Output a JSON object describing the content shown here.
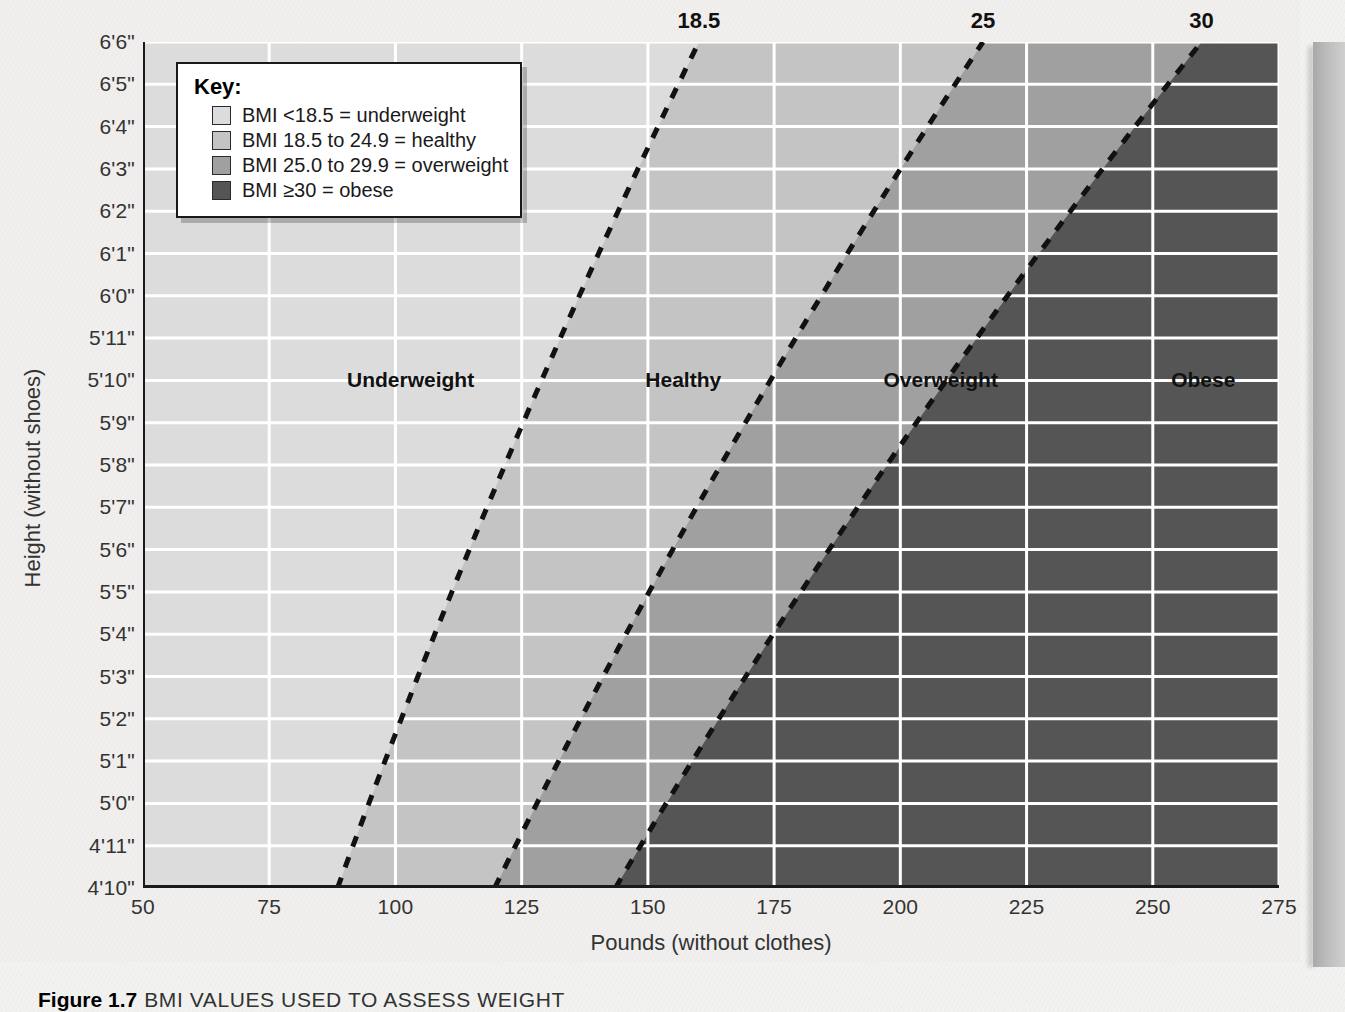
{
  "figure": {
    "caption_figure_number": "Figure 1.7",
    "caption_text": "BMI VALUES USED TO ASSESS WEIGHT"
  },
  "axes": {
    "x_title": "Pounds (without clothes)",
    "y_title": "Height (without shoes)",
    "x_ticks": [
      "50",
      "75",
      "100",
      "125",
      "150",
      "175",
      "200",
      "225",
      "250",
      "275"
    ],
    "y_ticks": [
      "6'6\"",
      "6'5\"",
      "6'4\"",
      "6'3\"",
      "6'2\"",
      "6'1\"",
      "6'0\"",
      "5'11\"",
      "5'10\"",
      "5'9\"",
      "5'8\"",
      "5'7\"",
      "5'6\"",
      "5'5\"",
      "5'4\"",
      "5'3\"",
      "5'2\"",
      "5'1\"",
      "5'0\"",
      "4'11\"",
      "4'10\""
    ]
  },
  "key": {
    "title": "Key:",
    "items": [
      {
        "label": "BMI <18.5 = underweight",
        "color": "#dcdcdc"
      },
      {
        "label": "BMI 18.5 to 24.9 = healthy",
        "color": "#c4c4c4"
      },
      {
        "label": "BMI 25.0 to 29.9 = overweight",
        "color": "#a0a0a0"
      },
      {
        "label": "BMI ≥30 = obese",
        "color": "#555555"
      }
    ]
  },
  "region_labels": [
    {
      "label": "Underweight",
      "x_lb": 103,
      "y_height_in": 70
    },
    {
      "label": "Healthy",
      "x_lb": 157,
      "y_height_in": 70
    },
    {
      "label": "Overweight",
      "x_lb": 208,
      "y_height_in": 70
    },
    {
      "label": "Obese",
      "x_lb": 260,
      "y_height_in": 70
    }
  ],
  "top_boundary_labels": [
    {
      "label": "18.5",
      "bmi": 18.5
    },
    {
      "label": "25",
      "bmi": 25
    },
    {
      "label": "30",
      "bmi": 30
    }
  ],
  "chart_data": {
    "type": "area",
    "title": "BMI VALUES USED TO ASSESS WEIGHT",
    "xlabel": "Pounds (without clothes)",
    "ylabel": "Height (without shoes)",
    "xlim": [
      50,
      275
    ],
    "ylim_inches": [
      58,
      78
    ],
    "x_major_step": 25,
    "x_minor_step": 5,
    "grid": true,
    "grid_color": "#ffffff",
    "formula": "BMI = 703 * pounds / inches^2",
    "boundary_lines": [
      {
        "bmi": 18.5,
        "label": "18.5",
        "style": "dashed",
        "points_lb_at_height_in": [
          {
            "height_in": 58,
            "pounds": 88.5
          },
          {
            "height_in": 62,
            "pounds": 101.2
          },
          {
            "height_in": 66,
            "pounds": 114.6
          },
          {
            "height_in": 70,
            "pounds": 128.9
          },
          {
            "height_in": 74,
            "pounds": 144.1
          },
          {
            "height_in": 78,
            "pounds": 160.1
          }
        ]
      },
      {
        "bmi": 25,
        "label": "25",
        "style": "dashed",
        "points_lb_at_height_in": [
          {
            "height_in": 58,
            "pounds": 119.6
          },
          {
            "height_in": 62,
            "pounds": 136.7
          },
          {
            "height_in": 66,
            "pounds": 154.9
          },
          {
            "height_in": 70,
            "pounds": 174.2
          },
          {
            "height_in": 74,
            "pounds": 194.7
          },
          {
            "height_in": 78,
            "pounds": 216.4
          }
        ]
      },
      {
        "bmi": 30,
        "label": "30",
        "style": "dashed",
        "points_lb_at_height_in": [
          {
            "height_in": 58,
            "pounds": 143.5
          },
          {
            "height_in": 62,
            "pounds": 164.0
          },
          {
            "height_in": 66,
            "pounds": 185.8
          },
          {
            "height_in": 70,
            "pounds": 209.1
          },
          {
            "height_in": 74,
            "pounds": 233.7
          },
          {
            "height_in": 78,
            "pounds": 259.7
          }
        ]
      }
    ],
    "bands": [
      {
        "name": "Underweight",
        "bmi_range": [
          0,
          18.5
        ],
        "color": "#dcdcdc"
      },
      {
        "name": "Healthy",
        "bmi_range": [
          18.5,
          25
        ],
        "color": "#c4c4c4"
      },
      {
        "name": "Overweight",
        "bmi_range": [
          25,
          30
        ],
        "color": "#a0a0a0"
      },
      {
        "name": "Obese",
        "bmi_range": [
          30,
          100
        ],
        "color": "#555555"
      }
    ]
  }
}
